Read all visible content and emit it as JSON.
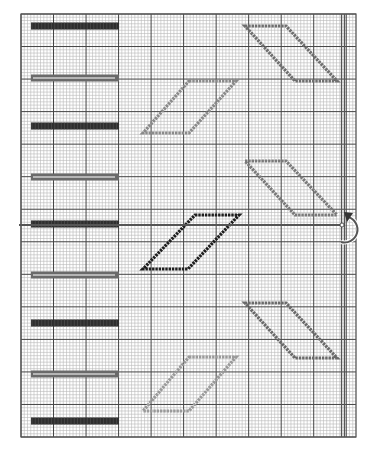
{
  "diagram": {
    "type": "stitch-chart",
    "grid": {
      "left": 21,
      "top": 14,
      "right": 356,
      "bottom": 437,
      "minor_step": 3.25,
      "major_every": 10,
      "minor_color": "#b8b8b8",
      "major_color": "#444444",
      "border_color": "#555555"
    },
    "center_lines": {
      "vertical_x": 343,
      "horizontal_y": 225,
      "color": "#555555"
    },
    "bars": [
      {
        "y": 26,
        "style": "dark"
      },
      {
        "y": 78,
        "style": "outline"
      },
      {
        "y": 126,
        "style": "dark"
      },
      {
        "y": 177,
        "style": "outline"
      },
      {
        "y": 224,
        "style": "dark"
      },
      {
        "y": 275,
        "style": "outline"
      },
      {
        "y": 323,
        "style": "dark"
      },
      {
        "y": 374,
        "style": "outline"
      },
      {
        "y": 421,
        "style": "dark"
      }
    ],
    "bar_x_start": 31,
    "bar_x_end": 119,
    "bar_colors": {
      "dark": "#2e2e2e",
      "outline": "#6a6a6a"
    },
    "parallelograms": [
      {
        "name": "top-right",
        "points": [
          [
            245,
            26
          ],
          [
            286,
            26
          ],
          [
            337,
            81
          ],
          [
            295,
            81
          ]
        ],
        "color": "#6f6f6f"
      },
      {
        "name": "upper-left",
        "points": [
          [
            189,
            81
          ],
          [
            236,
            81
          ],
          [
            189,
            133
          ],
          [
            143,
            133
          ]
        ],
        "color": "#8a8a8a"
      },
      {
        "name": "middle-right",
        "points": [
          [
            245,
            161
          ],
          [
            286,
            161
          ],
          [
            337,
            215
          ],
          [
            295,
            215
          ]
        ],
        "color": "#7a7a7a"
      },
      {
        "name": "center-black",
        "points": [
          [
            195,
            215
          ],
          [
            239,
            215
          ],
          [
            188,
            269
          ],
          [
            143,
            269
          ]
        ],
        "color": "#1e1e1e"
      },
      {
        "name": "lower-right",
        "points": [
          [
            245,
            303
          ],
          [
            286,
            303
          ],
          [
            337,
            358
          ],
          [
            295,
            358
          ]
        ],
        "color": "#6a6a6a"
      },
      {
        "name": "bottom-left",
        "points": [
          [
            189,
            357
          ],
          [
            236,
            357
          ],
          [
            189,
            411
          ],
          [
            143,
            411
          ]
        ],
        "color": "#9a9a9a"
      }
    ],
    "rotate_arrow": {
      "x": 343,
      "y": 225,
      "icon": "rotate-arrow-icon",
      "color": "#333333"
    }
  }
}
